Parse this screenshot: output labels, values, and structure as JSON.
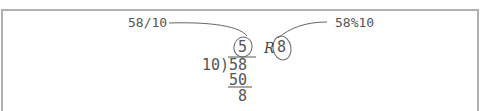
{
  "diagram": {
    "labels": {
      "quotient_expr": "58/10",
      "remainder_expr": "58%10"
    },
    "division": {
      "divisor": "10",
      "bracket": ")",
      "dividend": "58",
      "quotient": "5",
      "remainder_marker": "R",
      "remainder": "8",
      "subtrahend": "50",
      "difference": "8"
    },
    "colors": {
      "frame": "#b0b0b0",
      "text": "#555555",
      "annotation_line": "#666666"
    }
  }
}
